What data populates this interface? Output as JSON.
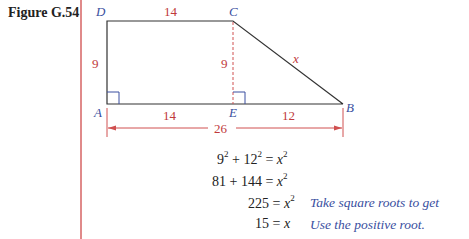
{
  "figure": {
    "label": "Figure G.54",
    "vertices": {
      "A": "A",
      "B": "B",
      "C": "C",
      "D": "D",
      "E": "E"
    },
    "dimensions": {
      "top_DC": "14",
      "left_DA": "9",
      "height_CE": "9",
      "hyp_CB": "x",
      "bottom_AE": "14",
      "bottom_EB": "12",
      "total_AB": "26"
    },
    "colors": {
      "lines": "#333333",
      "dimension_text": "#c0393b",
      "vertex_text": "#3a4fa0",
      "rule": "#e08a8a"
    }
  },
  "equations": [
    {
      "lhs_a": "9",
      "lhs_a_exp": "2",
      "op": "+",
      "lhs_b": "12",
      "lhs_b_exp": "2",
      "eq": "=",
      "rhs": "x",
      "rhs_exp": "2"
    },
    {
      "lhs_a": "81",
      "op": "+",
      "lhs_b": "144",
      "eq": "=",
      "rhs": "x",
      "rhs_exp": "2"
    },
    {
      "lhs": "225",
      "eq": "=",
      "rhs": "x",
      "rhs_exp": "2",
      "note": "Take square roots to get"
    },
    {
      "lhs": "15",
      "eq": "=",
      "rhs": "x",
      "note": "Use the positive root."
    }
  ]
}
